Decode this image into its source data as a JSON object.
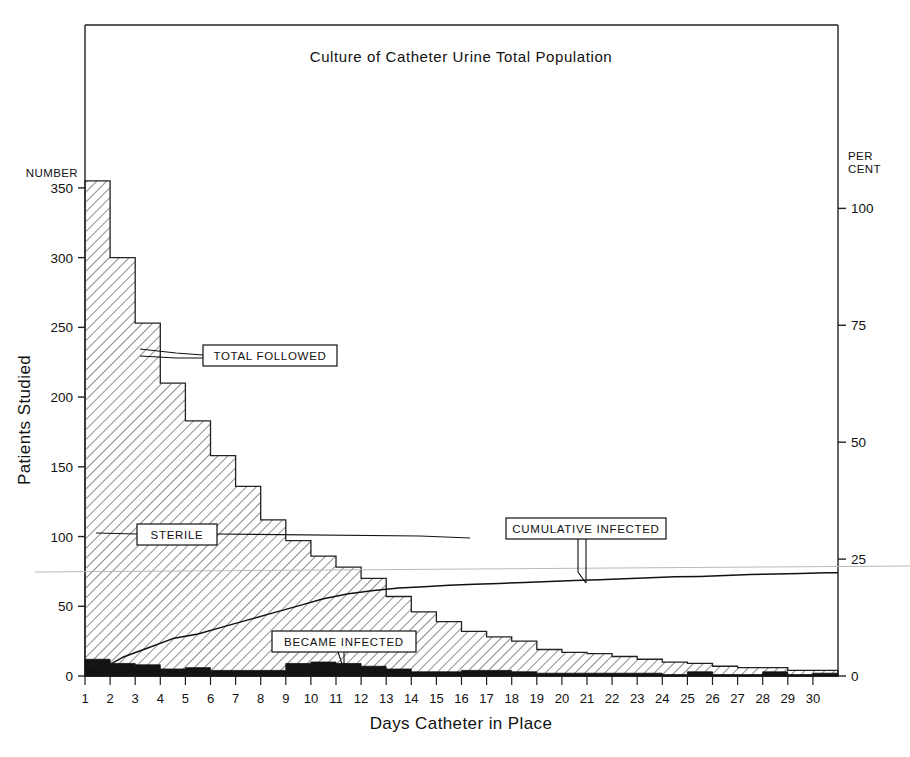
{
  "figure": {
    "title": "Culture of Catheter Urine Total Population",
    "left_axis_caption": "NUMBER",
    "left_axis_title": "Patients Studied",
    "right_axis_caption_line1": "PER",
    "right_axis_caption_line2": "CENT",
    "x_axis_title": "Days Catheter in Place",
    "callouts": {
      "total_followed": "TOTAL  FOLLOWED",
      "sterile": "STERILE",
      "cumulative_infected": "CUMULATIVE  INFECTED",
      "became_infected": "BECAME  INFECTED"
    },
    "colors": {
      "ink": "#111111",
      "hatch": "#6e6e6e",
      "infected_fill": "#141414",
      "axis": "#222222"
    }
  },
  "chart_data": {
    "type": "bar",
    "title": "Culture of Catheter Urine Total Population",
    "xlabel": "Days Catheter in Place",
    "ylabel": "Patients Studied",
    "y2label": "PER CENT",
    "ylim": [
      0,
      370
    ],
    "y2lim": [
      0,
      105
    ],
    "yticks": [
      0,
      50,
      100,
      150,
      200,
      250,
      300,
      350
    ],
    "yticklabels": [
      "0",
      "50",
      "100",
      "150",
      "200",
      "250",
      "300",
      "350"
    ],
    "y2ticks": [
      0,
      25,
      50,
      75,
      100
    ],
    "y2ticklabels": [
      "0",
      "25",
      "50",
      "75",
      "100"
    ],
    "grid": false,
    "legend": "inline-callout-boxes",
    "categories": [
      1,
      2,
      3,
      4,
      5,
      6,
      7,
      8,
      9,
      10,
      11,
      12,
      13,
      14,
      15,
      16,
      17,
      18,
      19,
      20,
      21,
      22,
      23,
      24,
      25,
      26,
      27,
      28,
      29,
      30
    ],
    "xticklabels": [
      "1",
      "2",
      "3",
      "4",
      "5",
      "6",
      "7",
      "8",
      "9",
      "10",
      "11",
      "12",
      "13",
      "14",
      "15",
      "16",
      "17",
      "18",
      "19",
      "20",
      "21",
      "22",
      "23",
      "24",
      "25",
      "26",
      "27",
      "28",
      "29",
      "30"
    ],
    "series": [
      {
        "name": "TOTAL FOLLOWED",
        "style": "hatched-step-histogram",
        "values": [
          355,
          300,
          253,
          210,
          183,
          158,
          136,
          112,
          97,
          86,
          78,
          70,
          57,
          46,
          39,
          32,
          28,
          25,
          19,
          17,
          16,
          14,
          12,
          10,
          9,
          7,
          6,
          6,
          4,
          4
        ]
      },
      {
        "name": "BECAME INFECTED",
        "style": "solid-black-step-histogram",
        "values": [
          12,
          9,
          8,
          5,
          6,
          4,
          4,
          4,
          9,
          10,
          9,
          7,
          5,
          3,
          3,
          4,
          4,
          3,
          2,
          2,
          2,
          2,
          2,
          1,
          3,
          1,
          1,
          3,
          1,
          2
        ]
      },
      {
        "name": "CUMULATIVE INFECTED",
        "style": "line",
        "axis": "right-percent",
        "values": [
          1,
          4,
          6,
          8,
          9,
          10.5,
          12,
          13.5,
          15,
          16.5,
          17.6,
          18.3,
          18.8,
          19.1,
          19.4,
          19.6,
          19.8,
          20.0,
          20.2,
          20.4,
          20.6,
          20.8,
          21.0,
          21.2,
          21.3,
          21.5,
          21.7,
          21.8,
          21.9,
          22.1
        ]
      },
      {
        "name": "STERILE",
        "style": "boundary-of-hatched-region",
        "note": "hatched region above the black infected band represents sterile cultures"
      }
    ]
  }
}
